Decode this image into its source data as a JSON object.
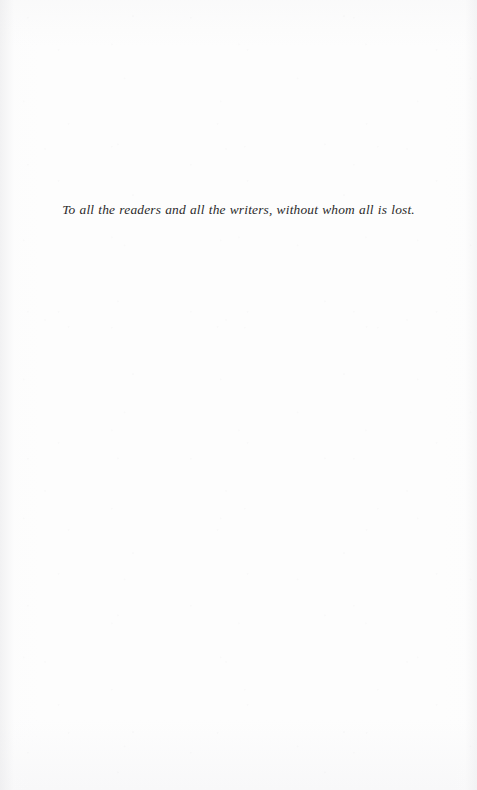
{
  "page": {
    "kind": "book-dedication-page",
    "background_color": "#fdfdfd",
    "text_color": "#2b2a2a"
  },
  "dedication": {
    "text": "To all the readers and all the writers, without whom all is lost."
  }
}
